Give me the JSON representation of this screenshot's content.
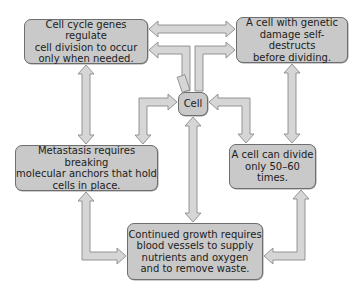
{
  "diagram": {
    "title": "",
    "center": {
      "id": "cell",
      "label": "Cell"
    },
    "nodes": [
      {
        "id": "cell_cycle_genes",
        "lines": [
          "Cell cycle genes regulate",
          "cell division to occur",
          "only when needed."
        ]
      },
      {
        "id": "genetic_damage",
        "lines": [
          "A cell with genetic",
          "damage self-destructs",
          "before dividing."
        ]
      },
      {
        "id": "metastasis",
        "lines": [
          "Metastasis requires breaking",
          "molecular anchors that hold",
          "cells in place."
        ]
      },
      {
        "id": "divide_limit",
        "lines": [
          "A cell can divide",
          "only 50–60",
          "times."
        ]
      },
      {
        "id": "continued_growth",
        "lines": [
          "Continued growth requires",
          "blood vessels to supply",
          "nutrients and oxygen",
          "and to remove waste."
        ]
      }
    ],
    "connections": [
      {
        "from": "cell_cycle_genes",
        "to": "genetic_damage",
        "type": "double-arrow"
      },
      {
        "from": "cell",
        "to": "cell_cycle_genes",
        "type": "arrow"
      },
      {
        "from": "cell",
        "to": "genetic_damage",
        "type": "arrow"
      },
      {
        "from": "cell",
        "to": "metastasis",
        "type": "arrow"
      },
      {
        "from": "cell",
        "to": "divide_limit",
        "type": "arrow"
      },
      {
        "from": "cell",
        "to": "continued_growth",
        "type": "double-arrow"
      },
      {
        "from": "cell_cycle_genes",
        "to": "metastasis",
        "type": "double-arrow"
      },
      {
        "from": "genetic_damage",
        "to": "divide_limit",
        "type": "double-arrow"
      },
      {
        "from": "metastasis",
        "to": "continued_growth",
        "type": "double-arrow"
      },
      {
        "from": "divide_limit",
        "to": "continued_growth",
        "type": "double-arrow"
      }
    ],
    "colors": {
      "box_fill": "#c9c9c9",
      "box_border": "#6e6e6e",
      "arrow_fill": "#d6d6d6",
      "arrow_stroke": "#8a8a8a",
      "text": "#1c1c1c"
    }
  }
}
